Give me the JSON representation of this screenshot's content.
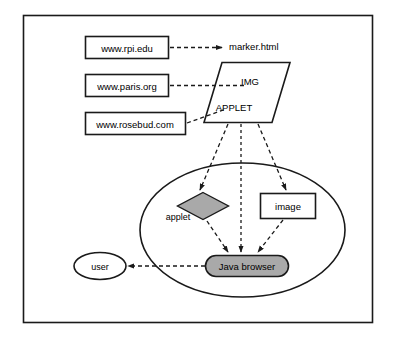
{
  "diagram": {
    "frame": {
      "name": "outer-frame",
      "stroke": "#1a1a1a",
      "fill": "#ffffff"
    },
    "colors": {
      "stroke": "#1a1a1a",
      "shape_fill_white": "#ffffff",
      "shape_fill_gray": "#a9a9a9",
      "text": "#000000",
      "dashed_line": "#1a1a1a"
    },
    "url_boxes": [
      {
        "id": "url-rpi",
        "label": "www.rpi.edu"
      },
      {
        "id": "url-paris",
        "label": "www.paris.org"
      },
      {
        "id": "url-rosebud",
        "label": "www.rosebud.com"
      }
    ],
    "document": {
      "id": "marker-document",
      "title": "marker.html",
      "tags": [
        {
          "id": "tag-img",
          "label": "IMG"
        },
        {
          "id": "tag-applet",
          "label": "APPLET"
        }
      ]
    },
    "browser_container": {
      "id": "java-browser-scope",
      "shape": "ellipse"
    },
    "objects": [
      {
        "id": "applet-object",
        "label": "applet",
        "shape": "diamond",
        "fill": "#a9a9a9"
      },
      {
        "id": "image-object",
        "label": "image",
        "shape": "rectangle",
        "fill": "#ffffff"
      }
    ],
    "browser": {
      "id": "java-browser",
      "label": "Java browser",
      "shape": "rounded-rectangle",
      "fill": "#a9a9a9"
    },
    "user": {
      "id": "user-actor",
      "label": "user",
      "shape": "ellipse"
    },
    "edges": [
      {
        "id": "edge-rpi-to-marker",
        "from": "www.rpi.edu",
        "to": "marker.html",
        "style": "dashed",
        "arrow": true
      },
      {
        "id": "edge-paris-to-img",
        "from": "www.paris.org",
        "to": "IMG",
        "style": "dashed",
        "arrow": false
      },
      {
        "id": "edge-rosebud-to-applet",
        "from": "www.rosebud.com",
        "to": "APPLET",
        "style": "dashed",
        "arrow": false
      },
      {
        "id": "edge-applet-tag-to-applet-object",
        "from": "APPLET",
        "to": "applet",
        "style": "dashed",
        "arrow": true
      },
      {
        "id": "edge-marker-to-browser",
        "from": "marker.html",
        "to": "Java browser",
        "style": "dashed",
        "arrow": true
      },
      {
        "id": "edge-img-tag-to-image-object",
        "from": "IMG",
        "to": "image",
        "style": "dashed",
        "arrow": true
      },
      {
        "id": "edge-applet-object-to-browser",
        "from": "applet",
        "to": "Java browser",
        "style": "dashed",
        "arrow": true
      },
      {
        "id": "edge-image-object-to-browser",
        "from": "image",
        "to": "Java browser",
        "style": "dashed",
        "arrow": true
      },
      {
        "id": "edge-browser-to-user",
        "from": "Java browser",
        "to": "user",
        "style": "dashed",
        "arrow": true
      }
    ]
  }
}
